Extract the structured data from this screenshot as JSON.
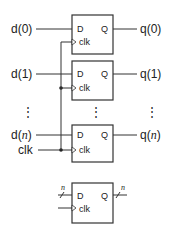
{
  "diagram": {
    "type": "register-of-d-flip-flops",
    "flipflops": [
      {
        "input": "d(0)",
        "output": "q(0)",
        "d_pin": "D",
        "q_pin": "Q",
        "clk_pin": "clk"
      },
      {
        "input": "d(1)",
        "output": "q(1)",
        "d_pin": "D",
        "q_pin": "Q",
        "clk_pin": "clk"
      },
      {
        "input_prefix": "d(",
        "input_var": "n",
        "input_suffix": ")",
        "output_prefix": "q(",
        "output_var": "n",
        "output_suffix": ")",
        "d_pin": "D",
        "q_pin": "Q",
        "clk_pin": "clk"
      }
    ],
    "clock_label": "clk",
    "ellipsis": "⋮",
    "symbol": {
      "d_pin": "D",
      "q_pin": "Q",
      "clk_pin": "clk",
      "bus_width_in": "n",
      "bus_width_out": "n"
    }
  }
}
